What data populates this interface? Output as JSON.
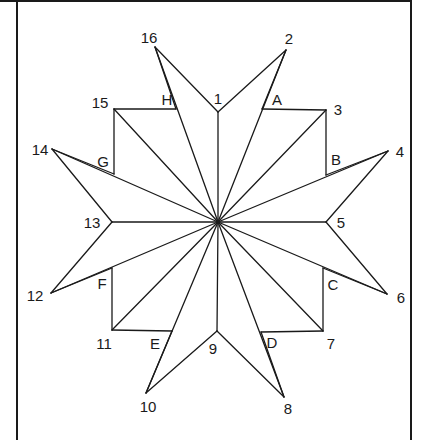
{
  "diagram": {
    "stroke_color": "#1a1a1a",
    "background": "#ffffff",
    "center": {
      "x": 218,
      "y": 222
    },
    "points": {
      "1": {
        "x": 218,
        "y": 112,
        "label": "1",
        "lx": 218,
        "ly": 104
      },
      "2": {
        "x": 286,
        "y": 50,
        "label": "2",
        "lx": 289,
        "ly": 44
      },
      "3": {
        "x": 326,
        "y": 110,
        "label": "3",
        "lx": 338,
        "ly": 115
      },
      "4": {
        "x": 388,
        "y": 151,
        "label": "4",
        "lx": 400,
        "ly": 157
      },
      "5": {
        "x": 326,
        "y": 222,
        "label": "5",
        "lx": 341,
        "ly": 228
      },
      "6": {
        "x": 387,
        "y": 294,
        "label": "6",
        "lx": 401,
        "ly": 303
      },
      "7": {
        "x": 323,
        "y": 331,
        "label": "7",
        "lx": 331,
        "ly": 349
      },
      "8": {
        "x": 284,
        "y": 397,
        "label": "8",
        "lx": 288,
        "ly": 414
      },
      "9": {
        "x": 217,
        "y": 331,
        "label": "9",
        "lx": 213,
        "ly": 354
      },
      "10": {
        "x": 146,
        "y": 393,
        "label": "10",
        "lx": 148,
        "ly": 412
      },
      "11": {
        "x": 112,
        "y": 330,
        "label": "11",
        "lx": 104,
        "ly": 349
      },
      "12": {
        "x": 51,
        "y": 293,
        "label": "12",
        "lx": 35,
        "ly": 301
      },
      "13": {
        "x": 112,
        "y": 222,
        "label": "13",
        "lx": 92,
        "ly": 228
      },
      "14": {
        "x": 52,
        "y": 149,
        "label": "14",
        "lx": 40,
        "ly": 155
      },
      "15": {
        "x": 114,
        "y": 109,
        "label": "15",
        "lx": 100,
        "ly": 108
      },
      "16": {
        "x": 155,
        "y": 47,
        "label": "16",
        "lx": 149,
        "ly": 43
      },
      "A": {
        "x": 262,
        "y": 109,
        "label": "A",
        "lx": 277,
        "ly": 105
      },
      "B": {
        "x": 326,
        "y": 175,
        "label": "B",
        "lx": 336,
        "ly": 165
      },
      "C": {
        "x": 323,
        "y": 268,
        "label": "C",
        "lx": 333,
        "ly": 290
      },
      "D": {
        "x": 261,
        "y": 332,
        "label": "D",
        "lx": 272,
        "ly": 348
      },
      "E": {
        "x": 172,
        "y": 331,
        "label": "E",
        "lx": 155,
        "ly": 349
      },
      "F": {
        "x": 112,
        "y": 268,
        "label": "F",
        "lx": 102,
        "ly": 289
      },
      "G": {
        "x": 114,
        "y": 174,
        "label": "G",
        "lx": 103,
        "ly": 167
      },
      "H": {
        "x": 176,
        "y": 109,
        "label": "H",
        "lx": 167,
        "ly": 105
      }
    },
    "spokes": [
      "1",
      "2",
      "3",
      "4",
      "5",
      "6",
      "7",
      "8",
      "9",
      "10",
      "11",
      "12",
      "13",
      "14",
      "15",
      "16"
    ],
    "outline": [
      [
        "1",
        "2"
      ],
      [
        "2",
        "A"
      ],
      [
        "A",
        "3"
      ],
      [
        "3",
        "B"
      ],
      [
        "B",
        "4"
      ],
      [
        "4",
        "5"
      ],
      [
        "5",
        "6"
      ],
      [
        "6",
        "C"
      ],
      [
        "C",
        "7"
      ],
      [
        "7",
        "D"
      ],
      [
        "D",
        "8"
      ],
      [
        "8",
        "9"
      ],
      [
        "9",
        "10"
      ],
      [
        "10",
        "E"
      ],
      [
        "E",
        "11"
      ],
      [
        "11",
        "F"
      ],
      [
        "F",
        "12"
      ],
      [
        "12",
        "13"
      ],
      [
        "13",
        "14"
      ],
      [
        "14",
        "G"
      ],
      [
        "G",
        "15"
      ],
      [
        "15",
        "H"
      ],
      [
        "H",
        "16"
      ],
      [
        "16",
        "1"
      ]
    ],
    "label_order": [
      "1",
      "2",
      "3",
      "4",
      "5",
      "6",
      "7",
      "8",
      "9",
      "10",
      "11",
      "12",
      "13",
      "14",
      "15",
      "16",
      "A",
      "B",
      "C",
      "D",
      "E",
      "F",
      "G",
      "H"
    ]
  }
}
